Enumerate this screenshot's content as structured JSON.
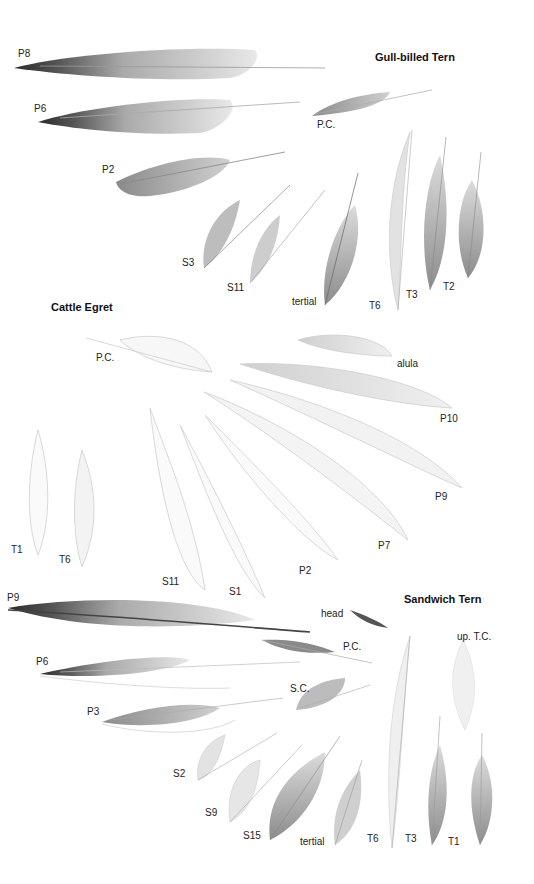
{
  "plate": {
    "sections": [
      {
        "title": "Gull-billed Tern",
        "labels": [
          "P8",
          "P6",
          "P.C.",
          "P2",
          "S3",
          "S11",
          "tertial",
          "T6",
          "T3",
          "T2"
        ]
      },
      {
        "title": "Cattle Egret",
        "labels": [
          "P.C.",
          "alula",
          "P10",
          "P9",
          "P7",
          "P2",
          "S1",
          "S11",
          "T1",
          "T6"
        ]
      },
      {
        "title": "Sandwich Tern",
        "labels": [
          "P9",
          "head",
          "P.C.",
          "up. T.C.",
          "P6",
          "S.C.",
          "P3",
          "S2",
          "S9",
          "S15",
          "tertial",
          "T6",
          "T3",
          "T1"
        ]
      }
    ]
  },
  "colors": {
    "background": "#ffffff",
    "text": "#222222",
    "feather_dark": "#3a3a3a",
    "feather_mid": "#9a9a9a",
    "feather_light": "#d8d8d8"
  }
}
